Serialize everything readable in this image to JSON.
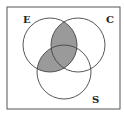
{
  "diagram": {
    "type": "venn",
    "sets": [
      {
        "id": "E",
        "label": "E",
        "cx": 50,
        "cy": 45,
        "r": 27
      },
      {
        "id": "C",
        "label": "C",
        "cx": 78,
        "cy": 45,
        "r": 27
      },
      {
        "id": "S",
        "label": "S",
        "cx": 64,
        "cy": 72,
        "r": 27
      }
    ],
    "shaded_regions": [
      "E∩C",
      "E∩S"
    ],
    "shaded_expression": "E ∩ (C ∪ S)",
    "colors": {
      "shade": "#9a9a9a",
      "stroke": "#444444",
      "frame": "#555555",
      "background": "#ffffff"
    }
  }
}
